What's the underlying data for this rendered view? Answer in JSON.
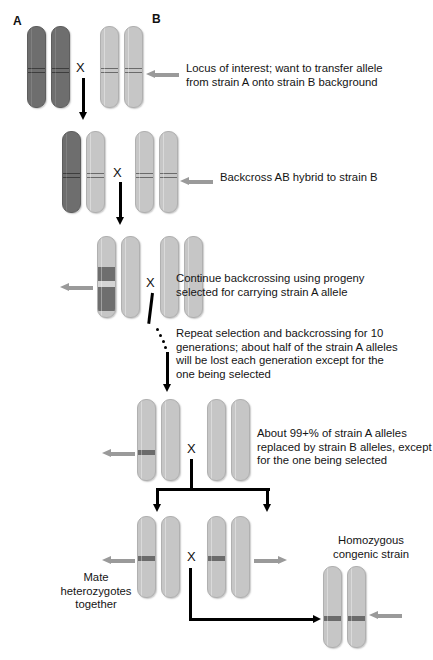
{
  "figure": {
    "strain_labels": {
      "a": "A",
      "b": "B"
    },
    "cross_symbol": "X"
  },
  "annotations": [
    {
      "id": "locus-of-interest",
      "text": "Locus of interest; want to transfer allele\nfrom strain A onto strain B background",
      "arrow": "left"
    },
    {
      "id": "backcross-ab",
      "text": "Backcross AB hybrid to strain B",
      "arrow": "left"
    },
    {
      "id": "continue-backcrossing",
      "text": "Continue backcrossing using progeny\nselected for carrying strain A allele",
      "arrow": "left"
    },
    {
      "id": "repeat-selection",
      "text": "Repeat selection and backcrossing for 10\ngenerations; about half of the strain A alleles\nwill be lost each generation except for the\none being selected",
      "arrow": "none"
    },
    {
      "id": "ninety-nine-percent",
      "text": "About 99+% of strain A alleles\nreplaced by strain B alleles, except\nfor the one being selected",
      "arrow": "left"
    },
    {
      "id": "mate-heterozygotes",
      "text": "Mate\nheterozygotes\ntogether",
      "arrow": "none"
    },
    {
      "id": "homozygous-congenic",
      "text": "Homozygous\ncongenic strain",
      "arrow": "left"
    }
  ],
  "generations": [
    {
      "id": "gen-parental",
      "label": "Parental cross A x B",
      "parents": [
        {
          "strain": "A",
          "chromosomes": [
            "dark",
            "dark"
          ]
        },
        {
          "strain": "B",
          "chromosomes": [
            "light",
            "light"
          ]
        }
      ]
    },
    {
      "id": "gen-f1",
      "label": "AB hybrid backcrossed to strain B",
      "parents": [
        {
          "strain": "AB",
          "chromosomes": [
            "dark",
            "light"
          ]
        },
        {
          "strain": "B",
          "chromosomes": [
            "light",
            "light"
          ]
        }
      ]
    },
    {
      "id": "gen-backcross-2",
      "label": "Progeny carrying strain A allele segment",
      "parents": [
        {
          "strain": "recombinant",
          "chromosomes": [
            "segment",
            "light"
          ]
        },
        {
          "strain": "B",
          "chromosomes": [
            "light",
            "light"
          ]
        }
      ]
    },
    {
      "id": "gen-backcross-10",
      "label": "After 10 generations of backcrossing",
      "parents": [
        {
          "strain": "congenic-het",
          "chromosomes": [
            "band",
            "light"
          ]
        },
        {
          "strain": "B",
          "chromosomes": [
            "light",
            "light"
          ]
        }
      ]
    },
    {
      "id": "gen-intercross",
      "label": "Mate heterozygotes together",
      "parents": [
        {
          "strain": "congenic-het",
          "chromosomes": [
            "band",
            "light"
          ]
        },
        {
          "strain": "congenic-het",
          "chromosomes": [
            "band",
            "light"
          ]
        }
      ]
    },
    {
      "id": "gen-homozygous",
      "label": "Homozygous congenic strain",
      "parents": [
        {
          "strain": "congenic-hom",
          "chromosomes": [
            "band",
            "band"
          ]
        }
      ]
    }
  ],
  "colors": {
    "strain_a_dark": "#6e6e6e",
    "strain_b_light": "#c6c6c6",
    "locus_band": "#6b6b6b",
    "gray_arrow": "#9a9a9a",
    "black_arrow": "#000000",
    "text": "#141414",
    "background": "#ffffff"
  }
}
